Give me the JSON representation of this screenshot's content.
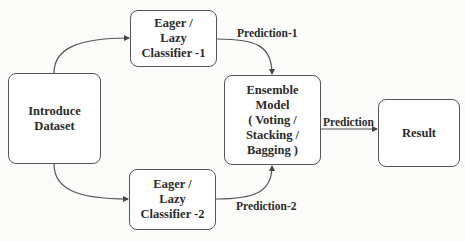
{
  "diagram": {
    "type": "flowchart",
    "nodes": {
      "dataset": {
        "lines": [
          "Introduce",
          "Dataset"
        ]
      },
      "classifier1": {
        "lines": [
          "Eager /",
          "Lazy",
          "Classifier -1"
        ]
      },
      "classifier2": {
        "lines": [
          "Eager /",
          "Lazy",
          "Classifier -2"
        ]
      },
      "ensemble": {
        "lines": [
          "Ensemble",
          "Model",
          "( Voting /",
          "Stacking /",
          "Bagging )"
        ]
      },
      "result": {
        "lines": [
          "Result"
        ]
      }
    },
    "edges": [
      {
        "from": "dataset",
        "to": "classifier1",
        "label": ""
      },
      {
        "from": "dataset",
        "to": "classifier2",
        "label": ""
      },
      {
        "from": "classifier1",
        "to": "ensemble",
        "label": "Prediction-1"
      },
      {
        "from": "classifier2",
        "to": "ensemble",
        "label": "Prediction-2"
      },
      {
        "from": "ensemble",
        "to": "result",
        "label": "Prediction"
      }
    ],
    "labels": {
      "prediction1": "Prediction-1",
      "prediction2": "Prediction-2",
      "prediction": "Prediction"
    },
    "colors": {
      "stroke": "#555555",
      "text": "#2b2b2b",
      "node_fill": "#ffffff",
      "background": "#fbfbfa"
    }
  }
}
